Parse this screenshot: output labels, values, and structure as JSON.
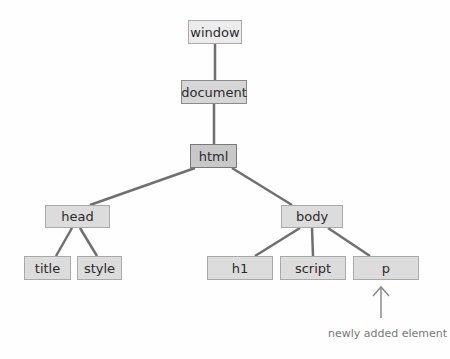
{
  "diagram": {
    "type": "DOM tree",
    "nodes": {
      "window": "window",
      "document": "document",
      "html": "html",
      "head": "head",
      "body": "body",
      "title": "title",
      "style": "style",
      "h1": "h1",
      "script": "script",
      "p": "p"
    },
    "edges": [
      [
        "window",
        "document"
      ],
      [
        "document",
        "html"
      ],
      [
        "html",
        "head"
      ],
      [
        "html",
        "body"
      ],
      [
        "head",
        "title"
      ],
      [
        "head",
        "style"
      ],
      [
        "body",
        "h1"
      ],
      [
        "body",
        "script"
      ],
      [
        "body",
        "p"
      ]
    ],
    "annotation": {
      "target": "p",
      "label": "newly added element",
      "icon": "up-arrow"
    },
    "colors": {
      "line": "#6f6f6f",
      "node_light": "#ececec",
      "node_dark": "#c8c8c8"
    }
  }
}
